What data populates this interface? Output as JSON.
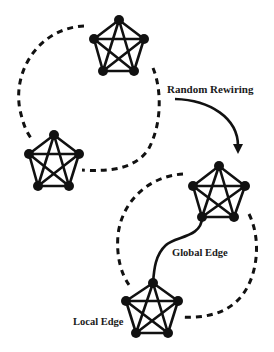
{
  "diagram": {
    "labels": {
      "random_rewiring": "Random Rewiring",
      "global_edge": "Global Edge",
      "local_edge": "Local Edge"
    },
    "clusters": [
      {
        "id": "cluster-top",
        "nodes": 5,
        "type": "complete-graph-K5"
      },
      {
        "id": "cluster-left",
        "nodes": 5,
        "type": "complete-graph-K5"
      },
      {
        "id": "cluster-right",
        "nodes": 5,
        "type": "complete-graph-K5"
      },
      {
        "id": "cluster-bottom",
        "nodes": 5,
        "type": "complete-graph-K5"
      }
    ],
    "connections": [
      {
        "from": "cluster-top",
        "to": "cluster-left",
        "style": "dashed-ring"
      },
      {
        "from": "cluster-right",
        "to": "cluster-bottom",
        "style": "dashed-ring"
      },
      {
        "from": "cluster-right",
        "to": "cluster-bottom",
        "style": "solid",
        "label_key": "global_edge"
      }
    ],
    "arrow": {
      "label_key": "random_rewiring",
      "direction": "before-to-after"
    },
    "colors": {
      "ink": "#111111",
      "background": "#ffffff"
    }
  }
}
